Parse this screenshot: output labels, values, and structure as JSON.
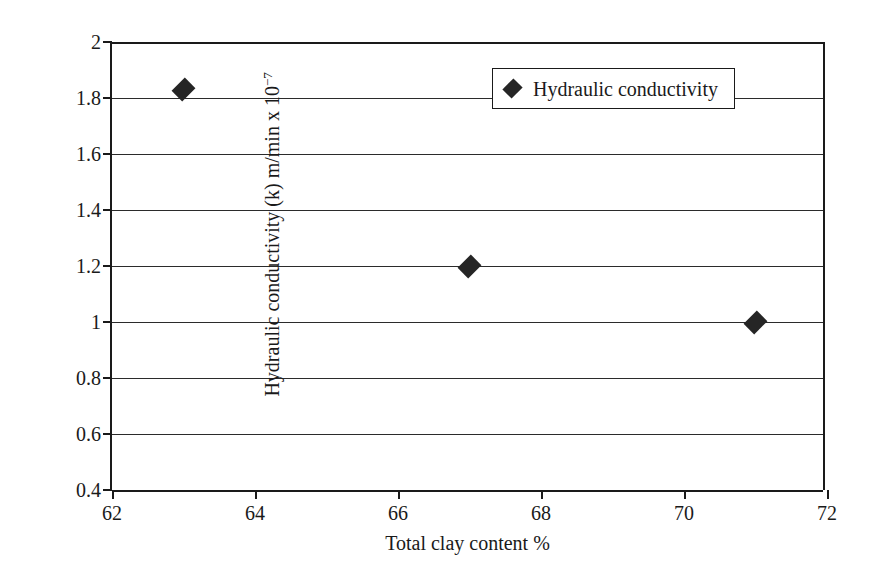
{
  "chart_data": {
    "type": "scatter",
    "title": "",
    "xlabel": "Total clay content %",
    "ylabel": "Hydraulic conductivity (k) m/min x 10",
    "ylabel_exponent": "−7",
    "xlim": [
      62,
      72
    ],
    "ylim": [
      0.4,
      2
    ],
    "xticks": [
      62,
      64,
      66,
      68,
      70,
      72
    ],
    "yticks": [
      0.4,
      0.6,
      0.8,
      1,
      1.2,
      1.4,
      1.6,
      1.8,
      2
    ],
    "grid": "horizontal",
    "legend_position": "top-right",
    "series": [
      {
        "name": "Hydraulic conductivity",
        "marker": "diamond",
        "color": "#252525",
        "points": [
          {
            "x": 63,
            "y": 1.83
          },
          {
            "x": 67,
            "y": 1.2
          },
          {
            "x": 71,
            "y": 1.0
          }
        ]
      }
    ]
  },
  "legend": {
    "entries": [
      {
        "label": "Hydraulic conductivity",
        "marker": "diamond-marker"
      }
    ]
  },
  "axis": {
    "x_title": "Total clay content %",
    "y_title_main": "Hydraulic conductivity (k) m/min x 10",
    "y_title_sup": "−7"
  },
  "colors": {
    "marker": "#252525",
    "axis": "#1a1a1a",
    "grid": "#2b2b2b",
    "background": "#ffffff"
  }
}
